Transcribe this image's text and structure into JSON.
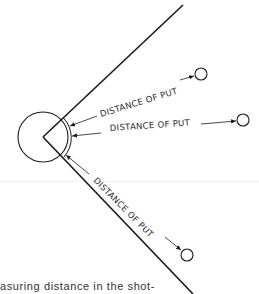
{
  "diagram": {
    "labels": [
      {
        "id": "upper",
        "text": "DISTANCE OF PUT"
      },
      {
        "id": "middle",
        "text": "DISTANCE OF PUT"
      },
      {
        "id": "lower",
        "text": "DISTANCE OF PUT"
      }
    ],
    "elements": {
      "throwing_circle": {
        "cx": 43,
        "cy": 137,
        "r": 25
      },
      "toe_board_arc": {
        "r": 29
      },
      "sector_lines": 2,
      "shot_landings": 3
    },
    "colors": {
      "ink": "#1a1a1a",
      "background": "#ffffff"
    }
  },
  "caption": {
    "text": "asuring distance in the shot-"
  }
}
